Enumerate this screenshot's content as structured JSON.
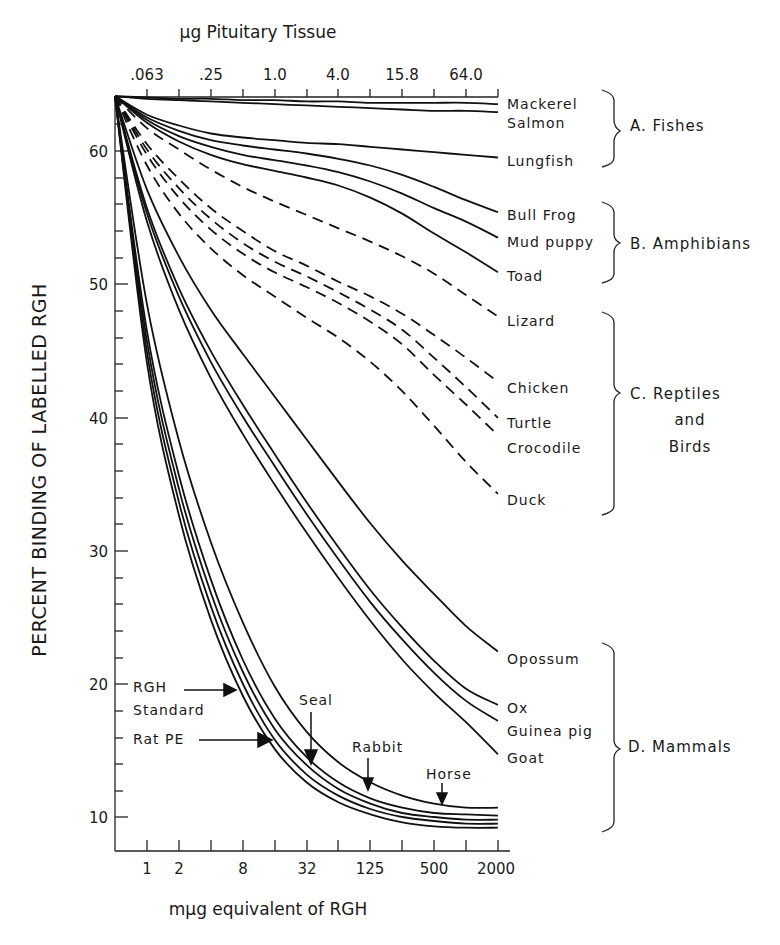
{
  "chart_data": {
    "type": "line",
    "title": "",
    "top_axis": {
      "label": "µg Pituitary Tissue",
      "tick_labels": [
        ".063",
        ".25",
        "1.0",
        "4.0",
        "15.8",
        "64.0"
      ]
    },
    "xlabel": "mµg equivalent of RGH",
    "x_tick_labels": [
      "1",
      "2",
      "8",
      "32",
      "125",
      "500",
      "2000"
    ],
    "x_ticks_positions": [
      1,
      2,
      4,
      8,
      16,
      32,
      64,
      125,
      250,
      500,
      1000,
      2000
    ],
    "x_scale": "log2",
    "ylabel": "PERCENT BINDING OF LABELLED RGH",
    "y_tick_labels": [
      "10",
      "20",
      "30",
      "40",
      "50",
      "60"
    ],
    "ylim": [
      8,
      64
    ],
    "grid": false,
    "legend_position": "right, direct labels",
    "x": [
      0,
      1,
      2,
      4,
      8,
      16,
      32,
      64,
      125,
      250,
      500,
      1000,
      2000
    ],
    "groups": [
      {
        "name": "A. Fishes",
        "members": [
          "Mackerel",
          "Salmon",
          "Lungfish"
        ]
      },
      {
        "name": "B. Amphibians",
        "members": [
          "Bull Frog",
          "Mud puppy",
          "Toad"
        ]
      },
      {
        "name": "C. Reptiles and Birds",
        "members": [
          "Lizard",
          "Chicken",
          "Turtle",
          "Crocodile",
          "Duck"
        ]
      },
      {
        "name": "D. Mammals",
        "members": [
          "Opossum",
          "Ox",
          "Guinea pig",
          "Goat",
          "Horse",
          "Rabbit",
          "Seal",
          "RGH Standard",
          "Rat PE"
        ]
      }
    ],
    "series": [
      {
        "name": "Mackerel",
        "style": "solid",
        "values": [
          64,
          63.9,
          63.8,
          63.8,
          63.7,
          63.7,
          63.6,
          63.6,
          63.5,
          63.5,
          63.5,
          63.5,
          63.4
        ]
      },
      {
        "name": "Salmon",
        "style": "solid",
        "values": [
          64,
          63.8,
          63.7,
          63.6,
          63.5,
          63.4,
          63.3,
          63.2,
          63.1,
          63.0,
          62.9,
          62.9,
          62.8
        ]
      },
      {
        "name": "Lungfish",
        "style": "solid",
        "values": [
          64,
          62.6,
          61.8,
          61.2,
          60.9,
          60.7,
          60.5,
          60.4,
          60.2,
          60.0,
          59.8,
          59.6,
          59.4
        ]
      },
      {
        "name": "Bull Frog",
        "style": "solid",
        "values": [
          64,
          62.4,
          61.4,
          60.7,
          60.3,
          60.0,
          59.7,
          59.3,
          58.8,
          58.1,
          57.2,
          56.2,
          55.3
        ]
      },
      {
        "name": "Mud puppy",
        "style": "solid",
        "values": [
          64,
          62.2,
          61.0,
          60.2,
          59.6,
          59.2,
          58.8,
          58.3,
          57.6,
          56.7,
          55.6,
          54.6,
          53.4
        ]
      },
      {
        "name": "Toad",
        "style": "solid",
        "values": [
          64,
          62.0,
          60.6,
          59.6,
          58.9,
          58.4,
          57.9,
          57.3,
          56.4,
          55.2,
          53.7,
          52.3,
          50.8
        ]
      },
      {
        "name": "Lizard",
        "style": "dashed",
        "values": [
          64,
          61.6,
          60.0,
          58.5,
          57.2,
          56.1,
          55.1,
          54.1,
          53.1,
          52.0,
          50.7,
          49.1,
          47.5
        ]
      },
      {
        "name": "Chicken",
        "style": "dashed",
        "values": [
          64,
          60.4,
          57.8,
          55.6,
          53.9,
          52.4,
          51.3,
          50.1,
          49.0,
          47.7,
          46.1,
          44.4,
          42.6
        ]
      },
      {
        "name": "Turtle",
        "style": "dashed",
        "values": [
          64,
          60.0,
          57.1,
          54.8,
          53.0,
          51.6,
          50.5,
          49.3,
          48.0,
          46.5,
          44.4,
          42.2,
          39.9
        ]
      },
      {
        "name": "Crocodile",
        "style": "dashed",
        "values": [
          64,
          59.6,
          56.4,
          54.0,
          52.2,
          50.8,
          49.7,
          48.5,
          47.1,
          45.4,
          43.1,
          40.9,
          38.6
        ]
      },
      {
        "name": "Duck",
        "style": "dashed",
        "values": [
          64,
          58.8,
          55.2,
          52.6,
          50.6,
          49.0,
          47.4,
          45.9,
          44.1,
          41.9,
          39.3,
          36.6,
          34.2
        ]
      },
      {
        "name": "Opossum",
        "style": "solid",
        "values": [
          64,
          57.0,
          52.0,
          48.0,
          44.7,
          41.5,
          38.3,
          35.1,
          32.0,
          29.2,
          26.7,
          24.3,
          22.4
        ]
      },
      {
        "name": "Ox",
        "style": "solid",
        "values": [
          64,
          55.6,
          49.6,
          44.9,
          40.9,
          37.2,
          33.6,
          30.2,
          27.0,
          24.2,
          21.7,
          19.6,
          18.4
        ]
      },
      {
        "name": "Guinea pig",
        "style": "solid",
        "values": [
          64,
          55.2,
          49.0,
          44.1,
          40.0,
          36.3,
          32.7,
          29.3,
          26.1,
          23.3,
          20.8,
          18.7,
          17.2
        ]
      },
      {
        "name": "Goat",
        "style": "solid",
        "values": [
          64,
          54.6,
          48.0,
          42.9,
          38.7,
          34.9,
          31.3,
          27.9,
          24.7,
          21.8,
          19.3,
          17.1,
          14.7
        ]
      },
      {
        "name": "Horse",
        "style": "solid",
        "values": [
          64,
          48.4,
          38.2,
          30.6,
          24.6,
          19.8,
          16.4,
          14.1,
          12.6,
          11.6,
          11.0,
          10.7,
          10.7
        ]
      },
      {
        "name": "Rabbit",
        "style": "solid",
        "values": [
          64,
          46.4,
          35.6,
          27.8,
          21.8,
          17.4,
          14.5,
          12.6,
          11.4,
          10.7,
          10.3,
          10.2,
          10.1
        ]
      },
      {
        "name": "Seal",
        "style": "solid",
        "values": [
          64,
          45.6,
          34.6,
          26.8,
          20.9,
          16.6,
          13.9,
          12.1,
          11.0,
          10.3,
          10.0,
          9.8,
          9.8
        ]
      },
      {
        "name": "RGH Standard",
        "style": "solid",
        "values": [
          64,
          44.8,
          33.6,
          25.8,
          20.0,
          15.8,
          13.2,
          11.6,
          10.6,
          10.0,
          9.7,
          9.5,
          9.5
        ]
      },
      {
        "name": "Rat PE",
        "style": "solid",
        "values": [
          64,
          44.0,
          32.6,
          24.8,
          19.1,
          15.1,
          12.6,
          11.1,
          10.2,
          9.6,
          9.3,
          9.2,
          9.2
        ]
      }
    ],
    "annotations": [
      {
        "text": "RGH Standard",
        "type": "arrow",
        "points_to": "RGH Standard"
      },
      {
        "text": "Rat PE",
        "type": "arrow",
        "points_to": "Rat PE"
      },
      {
        "text": "Seal",
        "type": "arrow",
        "points_to": "Seal"
      },
      {
        "text": "Rabbit",
        "type": "arrow",
        "points_to": "Rabbit"
      },
      {
        "text": "Horse",
        "type": "arrow",
        "points_to": "Horse"
      }
    ]
  },
  "labels": {
    "top_axis_title": "µg Pituitary Tissue",
    "top_ticks": [
      ".063",
      ".25",
      "1.0",
      "4.0",
      "15.8",
      "64.0"
    ],
    "x_title": "mµg equivalent of RGH",
    "x_ticks": [
      "1",
      "2",
      "8",
      "32",
      "125",
      "500",
      "2000"
    ],
    "y_title": "PERCENT BINDING OF LABELLED RGH",
    "y_ticks": [
      "60",
      "50",
      "40",
      "30",
      "20",
      "10"
    ],
    "right": {
      "mackerel": "Mackerel",
      "salmon": "Salmon",
      "lungfish": "Lungfish",
      "bullfrog": "Bull Frog",
      "mudpuppy": "Mud puppy",
      "toad": "Toad",
      "lizard": "Lizard",
      "chicken": "Chicken",
      "turtle": "Turtle",
      "crocodile": "Crocodile",
      "duck": "Duck",
      "opossum": "Opossum",
      "ox": "Ox",
      "guineapig": "Guinea pig",
      "goat": "Goat"
    },
    "groups": {
      "fishes": "A. Fishes",
      "amphibians": "B. Amphibians",
      "reptiles_1": "C. Reptiles",
      "reptiles_2": "and",
      "reptiles_3": "Birds",
      "mammals": "D. Mammals"
    },
    "inner": {
      "rgh_1": "RGH",
      "rgh_2": "Standard",
      "ratpe": "Rat PE",
      "seal": "Seal",
      "rabbit": "Rabbit",
      "horse": "Horse"
    }
  }
}
